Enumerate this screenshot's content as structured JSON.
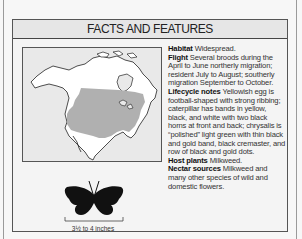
{
  "panel": {
    "title": "FACTS AND FEATURES"
  },
  "range_map": {
    "region": "North America",
    "highlight_color": "#b0b0b0",
    "land_color": "#ffffff",
    "water_color": "#e9e9e9"
  },
  "wingspan": {
    "label": "3½ to 4 inches",
    "icon": "butterfly-silhouette-icon"
  },
  "facts": [
    {
      "label": "Habitat",
      "text": "Widespread."
    },
    {
      "label": "Flight",
      "text": "Several broods during the April to June northerly migration; resident July to August; southerly migration September to October."
    },
    {
      "label": "Lifecycle notes",
      "text": "Yellowish egg is football-shaped with strong ribbing; caterpillar has bands in yellow, black, and white with two black horns at front and back; chrysalis is “polished” light green with thin black and gold band, black cremaster, and row of black and gold dots."
    },
    {
      "label": "Host plants",
      "text": "Milkweed."
    },
    {
      "label": "Nectar sources",
      "text": "Milkweed and many other species of wild and domestic flowers."
    }
  ]
}
